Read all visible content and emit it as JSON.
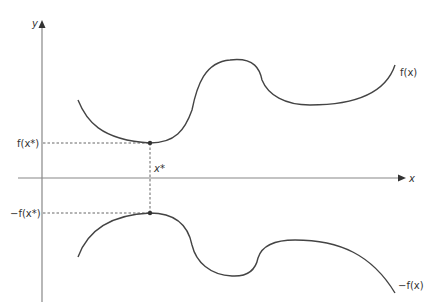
{
  "diagram": {
    "colors": {
      "axis": "#888888",
      "curve": "#444444",
      "text": "#333333"
    },
    "axes": {
      "x_label": "x",
      "y_label": "y"
    },
    "curves": [
      {
        "name": "f",
        "label": "f(x)"
      },
      {
        "name": "neg-f",
        "label": "−f(x)"
      }
    ],
    "annotations": {
      "x_star_label": "x*",
      "f_x_star_label": "f(x*)",
      "neg_f_x_star_label": "−f(x*)"
    }
  }
}
